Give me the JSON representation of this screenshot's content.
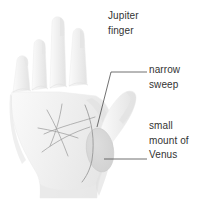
{
  "figure": {
    "background_color": "#ffffff",
    "hand_fill": "#f2f2f2",
    "hand_shade": "#e4e4e4",
    "line_color": "#9a9a9a",
    "leader_color": "#4d4d4d",
    "text_color": "#333333",
    "venus_mount_fill": "#d7d7d7"
  },
  "labels": [
    {
      "id": "jupiter-finger",
      "lines": [
        "Jupiter",
        "finger"
      ],
      "has_leader": false
    },
    {
      "id": "narrow-sweep",
      "lines": [
        "narrow",
        "sweep"
      ],
      "has_leader": true
    },
    {
      "id": "small-mount-of-venus",
      "lines": [
        "small",
        "mount of",
        "Venus"
      ],
      "has_leader": true
    }
  ],
  "annotations": {
    "jupiter": {
      "line1": "Jupiter",
      "line2": "finger"
    },
    "narrow": {
      "line1": "narrow",
      "line2": "sweep"
    },
    "venus": {
      "line1": "small",
      "line2": "mount of",
      "line3": "Venus"
    }
  }
}
